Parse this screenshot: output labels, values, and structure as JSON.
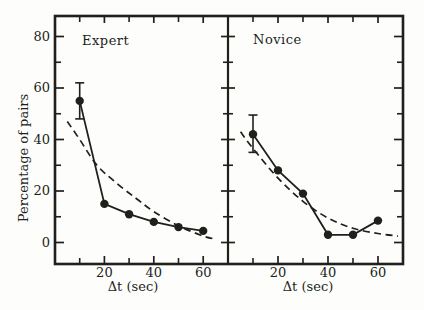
{
  "figure": {
    "background": "#fdfdfb",
    "ink": "#211f1c"
  },
  "chart_data": {
    "type": "line",
    "title": "",
    "ylabel": "Percentage of pairs",
    "xlabel": "Δt (sec)",
    "ylim": [
      0,
      88
    ],
    "yticks": [
      0,
      20,
      40,
      60,
      80
    ],
    "yticks_minor": [
      10,
      30,
      50,
      70
    ],
    "xlim": [
      0,
      70
    ],
    "xticks": [
      20,
      40,
      60
    ],
    "xticks_minor": [
      10,
      30,
      50,
      70
    ],
    "grid": false,
    "legend": "none",
    "panels": [
      {
        "title": "Expert",
        "series": [
          {
            "name": "model-fit",
            "style": "dashed",
            "x": [
              5,
              10,
              17,
              25,
              33,
              40,
              50,
              60,
              65
            ],
            "y": [
              47,
              40,
              30,
              23,
              17,
              12,
              6.5,
              2.5,
              1.3
            ]
          },
          {
            "name": "observed",
            "style": "solid-markers",
            "x": [
              10,
              20,
              30,
              40,
              50,
              60
            ],
            "y": [
              55,
              15,
              11,
              8,
              6,
              4.5
            ],
            "error_bars": [
              {
                "x": 10,
                "y": 55,
                "lo": 48,
                "hi": 62
              }
            ]
          }
        ]
      },
      {
        "title": "Novice",
        "series": [
          {
            "name": "model-fit",
            "style": "dashed",
            "x": [
              5,
              10,
              20,
              30,
              40,
              50,
              60,
              68
            ],
            "y": [
              43,
              36.5,
              25,
              16,
              9.5,
              5.5,
              3.5,
              2.5
            ]
          },
          {
            "name": "observed",
            "style": "solid-markers",
            "x": [
              10,
              20,
              30,
              40,
              50,
              60
            ],
            "y": [
              42,
              28,
              19,
              3,
              3,
              8.5
            ],
            "error_bars": [
              {
                "x": 10,
                "y": 42,
                "lo": 35,
                "hi": 49.5
              }
            ]
          }
        ]
      }
    ]
  }
}
